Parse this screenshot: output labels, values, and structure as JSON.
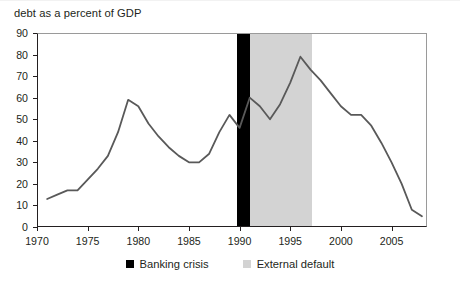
{
  "caption": "debt as a percent of GDP",
  "legend": {
    "items": [
      {
        "label": "Banking crisis",
        "color": "#000000",
        "swatch_name": "banking-crisis-swatch"
      },
      {
        "label": "External default",
        "color": "#d3d3d3",
        "swatch_name": "external-default-swatch"
      }
    ]
  },
  "chart_data": {
    "type": "line",
    "title": "",
    "subtitle": "",
    "xlabel": "",
    "ylabel": "debt as a percent of GDP",
    "xlim": [
      1970,
      2008.5
    ],
    "ylim": [
      0,
      90
    ],
    "yticks": [
      0,
      10,
      20,
      30,
      40,
      50,
      60,
      70,
      80,
      90
    ],
    "xticks": [
      1970,
      1975,
      1980,
      1985,
      1990,
      1995,
      2000,
      2005
    ],
    "ytick_labels": [
      "0",
      "10",
      "20",
      "30",
      "40",
      "50",
      "60",
      "70",
      "80",
      "90"
    ],
    "xtick_labels": [
      "1970",
      "1975",
      "1980",
      "1985",
      "1990",
      "1995",
      "2000",
      "2005"
    ],
    "grid": false,
    "legend_position": "bottom-center",
    "line_color": "#595959",
    "line_width": 1.8,
    "series": [
      {
        "name": "debt as a percent of GDP",
        "x": [
          1971,
          1972,
          1973,
          1974,
          1975,
          1976,
          1977,
          1978,
          1979,
          1980,
          1981,
          1982,
          1983,
          1984,
          1985,
          1986,
          1987,
          1988,
          1989,
          1990,
          1991,
          1992,
          1993,
          1994,
          1995,
          1996,
          1997,
          1998,
          1999,
          2000,
          2001,
          2002,
          2003,
          2004,
          2005,
          2006,
          2007,
          2008
        ],
        "y": [
          13,
          15,
          17,
          17,
          22,
          27,
          33,
          44,
          59,
          56,
          48,
          42,
          37,
          33,
          30,
          30,
          34,
          44,
          52,
          46,
          60,
          56,
          50,
          57,
          67,
          79,
          73,
          68,
          62,
          56,
          52,
          52,
          47,
          39,
          30,
          20,
          8,
          5
        ]
      }
    ],
    "shaded_bands": [
      {
        "name": "Banking crisis",
        "x_start": 1989.7,
        "x_end": 1991.0,
        "color": "#000000"
      },
      {
        "name": "External default",
        "x_start": 1991.0,
        "x_end": 1997.1,
        "color": "#d3d3d3"
      }
    ]
  }
}
